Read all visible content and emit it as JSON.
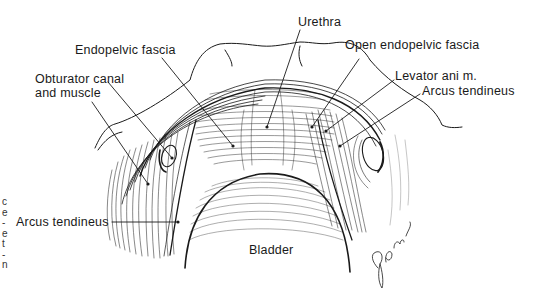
{
  "figure": {
    "type": "anatomical line illustration",
    "ink_color": "#1a1a1a",
    "background": "#ffffff"
  },
  "labels": {
    "urethra": "Urethra",
    "endopelvic_fascia": "Endopelvic fascia",
    "open_endopelvic_fascia": "Open endopelvic fascia",
    "obturator_line1": "Obturator canal",
    "obturator_line2": "and muscle",
    "levator_ani": "Levator ani m.",
    "arcus_tendineus_right": "Arcus tendineus",
    "arcus_tendineus_left": "Arcus tendineus",
    "bladder": "Bladder"
  },
  "signature": "Glo ryk",
  "edge_text_fragments": [
    "c",
    "e",
    "-",
    "e",
    "t",
    "-",
    "n"
  ]
}
